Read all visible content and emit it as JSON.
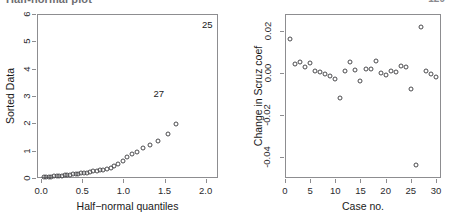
{
  "page": {
    "cutoff_caption": "Half-normal plot",
    "page_number": "129"
  },
  "chart_data": [
    {
      "id": "halfnormal",
      "type": "scatter",
      "title": "",
      "xlabel": "Half−normal quantiles",
      "ylabel": "Sorted Data",
      "xlim": [
        -0.05,
        2.15
      ],
      "ylim": [
        0,
        6
      ],
      "xticks": [
        0.0,
        0.5,
        1.0,
        1.5,
        2.0
      ],
      "xticklabels": [
        "0.0",
        "0.5",
        "1.0",
        "1.5",
        "2.0"
      ],
      "yticks": [
        0,
        1,
        2,
        3,
        4,
        5,
        6
      ],
      "yticklabels": [
        "0",
        "1",
        "2",
        "3",
        "4",
        "5",
        "6"
      ],
      "grid": false,
      "legend": null,
      "marker": "open-circle",
      "x": [
        0.031,
        0.062,
        0.094,
        0.125,
        0.157,
        0.189,
        0.221,
        0.253,
        0.286,
        0.319,
        0.352,
        0.385,
        0.419,
        0.454,
        0.489,
        0.524,
        0.561,
        0.598,
        0.636,
        0.675,
        0.715,
        0.757,
        0.8,
        0.845,
        0.891,
        0.94,
        0.992,
        1.047,
        1.107,
        1.171,
        1.243,
        1.325,
        1.421,
        1.54,
        1.645
      ],
      "y": [
        0.02,
        0.03,
        0.04,
        0.05,
        0.06,
        0.07,
        0.08,
        0.09,
        0.1,
        0.11,
        0.12,
        0.13,
        0.14,
        0.15,
        0.17,
        0.18,
        0.2,
        0.22,
        0.24,
        0.26,
        0.28,
        0.31,
        0.34,
        0.38,
        0.44,
        0.52,
        0.62,
        0.78,
        0.86,
        0.95,
        1.08,
        1.22,
        1.36,
        1.6,
        1.98
      ],
      "annotations": [
        {
          "label": "25",
          "x": 2.02,
          "y": 5.8,
          "note": "point clipped above plot frame"
        },
        {
          "label": "27",
          "x": 1.43,
          "y": 3.3,
          "note": "label above its point"
        }
      ]
    },
    {
      "id": "influence",
      "type": "scatter",
      "title": "",
      "xlabel": "Case no.",
      "ylabel": "Change in Scruz coef",
      "xlim": [
        0,
        31
      ],
      "ylim": [
        -0.05,
        0.028
      ],
      "xticks": [
        0,
        5,
        10,
        15,
        20,
        25,
        30
      ],
      "xticklabels": [
        "0",
        "5",
        "10",
        "15",
        "20",
        "25",
        "30"
      ],
      "yticks": [
        -0.04,
        -0.02,
        0.0,
        0.02
      ],
      "yticklabels": [
        "-0.04",
        "-0.02",
        "0.00",
        "0.02"
      ],
      "grid": false,
      "legend": null,
      "marker": "open-circle",
      "x": [
        1,
        2,
        3,
        4,
        5,
        6,
        7,
        8,
        9,
        10,
        11,
        12,
        13,
        14,
        15,
        16,
        17,
        18,
        19,
        20,
        21,
        22,
        23,
        24,
        25,
        26,
        27,
        28,
        29,
        30
      ],
      "y": [
        0.016,
        0.004,
        0.005,
        0.003,
        0.0045,
        0.001,
        0.0005,
        -0.0005,
        -0.0015,
        -0.003,
        -0.012,
        0.001,
        0.005,
        0.0015,
        -0.004,
        0.002,
        0.0018,
        0.0055,
        0.0,
        -0.001,
        0.001,
        0.0005,
        0.0035,
        0.003,
        -0.0075,
        -0.044,
        0.022,
        0.001,
        -0.0005,
        -0.002
      ]
    }
  ]
}
